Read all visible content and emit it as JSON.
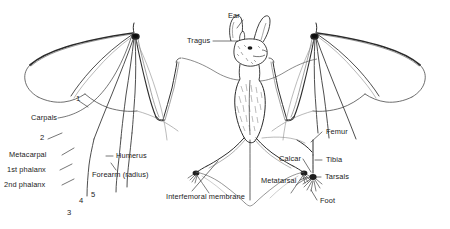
{
  "figure": {
    "background_color": "#ffffff",
    "ink_color": "#1b1b1b",
    "line_color": "#555555"
  },
  "labels": {
    "ear": "Ear",
    "tragus": "Tragus",
    "carpals": "Carpals",
    "metacarpal": "Metacarpal",
    "first_phalanx": "1st phalanx",
    "second_phalanx": "2nd phalanx",
    "humerus": "Humerus",
    "forearm": "Forearm (radius)",
    "interfemoral_membrane": "Interfemoral membrane",
    "femur": "Femur",
    "tibia": "Tibia",
    "calcar": "Calcar",
    "tarsals": "Tarsals",
    "metatarsal": "Metatarsal",
    "foot": "Foot"
  },
  "digits": {
    "one": "1",
    "two": "2",
    "three": "3",
    "four": "4",
    "five": "5"
  }
}
